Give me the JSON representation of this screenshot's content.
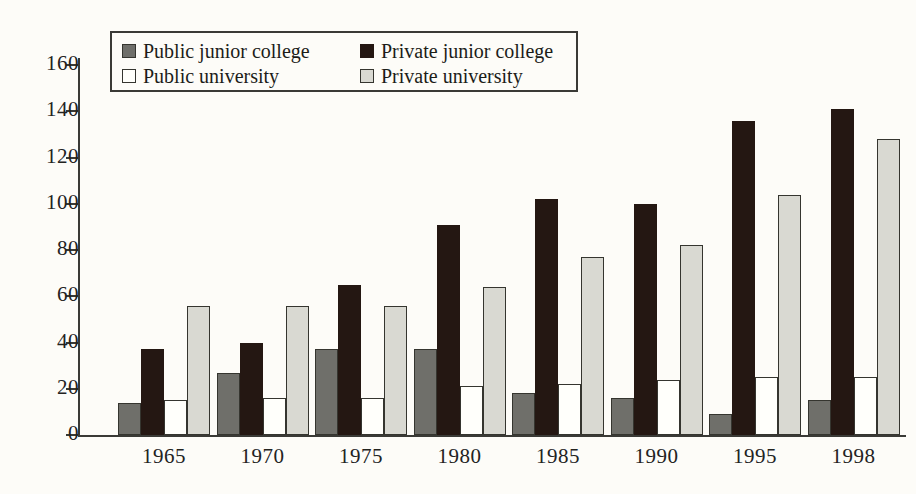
{
  "chart_data": {
    "type": "bar",
    "title": "",
    "xlabel": "",
    "ylabel": "",
    "categories": [
      "1965",
      "1970",
      "1975",
      "1980",
      "1985",
      "1990",
      "1995",
      "1998"
    ],
    "series": [
      {
        "name": "Public junior college",
        "color": "#6f6f6a",
        "values": [
          14,
          27,
          37,
          37,
          18,
          16,
          9,
          15
        ]
      },
      {
        "name": "Private junior college",
        "color": "#241712",
        "values": [
          37,
          40,
          65,
          91,
          102,
          100,
          136,
          141
        ]
      },
      {
        "name": "Public university",
        "color": "#fffffb",
        "values": [
          15,
          16,
          16,
          21,
          22,
          24,
          25,
          25
        ]
      },
      {
        "name": "Private university",
        "color": "#d9d9d2",
        "values": [
          56,
          56,
          56,
          64,
          77,
          82,
          104,
          128
        ]
      }
    ],
    "ylim": [
      0,
      160
    ],
    "yticks": [
      0,
      20,
      40,
      60,
      80,
      100,
      120,
      140,
      160
    ],
    "ytick_labels": [
      "0",
      "20",
      "40",
      "60",
      "80",
      "100",
      "120",
      "140",
      "160"
    ],
    "grid": false,
    "legend_position": "top-left"
  },
  "legend": {
    "entries": [
      {
        "label": "Public junior college"
      },
      {
        "label": "Private junior college"
      },
      {
        "label": "Public university"
      },
      {
        "label": "Private university"
      }
    ]
  }
}
